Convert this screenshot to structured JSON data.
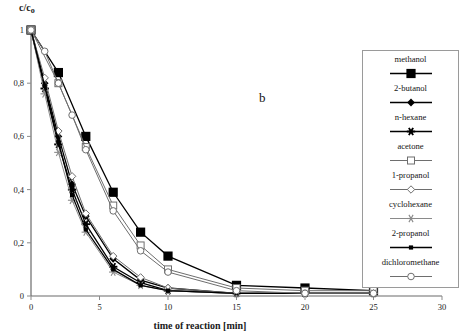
{
  "figure": {
    "panel_letter": "b",
    "ylabel_main": "c/c",
    "ylabel_sub": "o",
    "xlabel": "time of reaction  [min]"
  },
  "chart_data": {
    "type": "line",
    "title": "",
    "subtitle": "",
    "panel_label": "b",
    "xlabel": "time of reaction  [min]",
    "ylabel": "c/c₀",
    "xlim": [
      0,
      30
    ],
    "ylim": [
      0,
      1
    ],
    "xticks": [
      0,
      5,
      10,
      15,
      20,
      25,
      30
    ],
    "xtick_labels": [
      "0",
      "5",
      "10",
      "15",
      "20",
      "25",
      "30"
    ],
    "yticks": [
      0,
      0.2,
      0.4,
      0.6,
      0.8,
      1
    ],
    "ytick_labels": [
      "0",
      "0,2",
      "0,4",
      "0,6",
      "0,8",
      "1"
    ],
    "grid": false,
    "legend_position": "right-outside",
    "decimal_separator": ",",
    "series": [
      {
        "name": "methanol",
        "marker": "filled-square-large",
        "color": "#000000",
        "x": [
          0,
          2,
          4,
          6,
          8,
          10,
          15,
          20,
          25
        ],
        "y": [
          1.0,
          0.84,
          0.6,
          0.39,
          0.24,
          0.15,
          0.04,
          0.03,
          0.02
        ]
      },
      {
        "name": "2-butanol",
        "marker": "filled-diamond",
        "color": "#000000",
        "x": [
          0,
          1,
          2,
          3,
          4,
          6,
          8,
          10,
          15,
          20,
          25
        ],
        "y": [
          1.0,
          0.8,
          0.6,
          0.42,
          0.3,
          0.14,
          0.06,
          0.03,
          0.01,
          0.01,
          0.01
        ]
      },
      {
        "name": "n-hexane",
        "marker": "filled-star",
        "color": "#000000",
        "x": [
          0,
          1,
          2,
          3,
          4,
          6,
          8,
          10,
          15,
          20,
          25
        ],
        "y": [
          1.0,
          0.78,
          0.57,
          0.4,
          0.27,
          0.11,
          0.05,
          0.02,
          0.01,
          0.01,
          0.01
        ]
      },
      {
        "name": "acetone",
        "marker": "open-square",
        "color": "#6e6e6e",
        "x": [
          0,
          2,
          4,
          6,
          8,
          10,
          15,
          20,
          25
        ],
        "y": [
          1.0,
          0.8,
          0.56,
          0.34,
          0.19,
          0.1,
          0.03,
          0.02,
          0.02
        ]
      },
      {
        "name": "1-propanol",
        "marker": "open-diamond",
        "color": "#6e6e6e",
        "x": [
          0,
          1,
          2,
          3,
          4,
          6,
          8,
          10,
          15,
          20,
          25
        ],
        "y": [
          1.0,
          0.82,
          0.62,
          0.45,
          0.31,
          0.15,
          0.07,
          0.03,
          0.01,
          0.01,
          0.01
        ]
      },
      {
        "name": "cyclohexane",
        "marker": "gray-asterisk",
        "color": "#8a8a8a",
        "x": [
          0,
          1,
          2,
          3,
          4,
          6,
          8,
          10,
          15,
          20,
          25
        ],
        "y": [
          1.0,
          0.76,
          0.54,
          0.36,
          0.24,
          0.09,
          0.04,
          0.02,
          0.01,
          0.01,
          0.01
        ]
      },
      {
        "name": "2-propanol",
        "marker": "filled-square-small",
        "color": "#000000",
        "x": [
          0,
          1,
          2,
          3,
          4,
          6,
          8,
          10,
          15,
          20,
          25
        ],
        "y": [
          1.0,
          0.79,
          0.58,
          0.38,
          0.25,
          0.1,
          0.04,
          0.02,
          0.01,
          0.01,
          0.01
        ]
      },
      {
        "name": "dichloromethane",
        "marker": "open-circle",
        "color": "#6e6e6e",
        "x": [
          0,
          1,
          2,
          3,
          4,
          6,
          8,
          10,
          15,
          20,
          25
        ],
        "y": [
          1.0,
          0.92,
          0.8,
          0.68,
          0.55,
          0.32,
          0.17,
          0.09,
          0.02,
          0.01,
          0.01
        ]
      }
    ]
  },
  "legend": {
    "entries": [
      {
        "label": "methanol",
        "marker": "filled-square-large"
      },
      {
        "label": "2-butanol",
        "marker": "filled-diamond"
      },
      {
        "label": "n-hexane",
        "marker": "filled-star"
      },
      {
        "label": "acetone",
        "marker": "open-square"
      },
      {
        "label": "1-propanol",
        "marker": "open-diamond"
      },
      {
        "label": "cyclohexane",
        "marker": "gray-asterisk"
      },
      {
        "label": "2-propanol",
        "marker": "filled-square-small"
      },
      {
        "label": "dichloromethane",
        "marker": "open-circle"
      }
    ]
  }
}
